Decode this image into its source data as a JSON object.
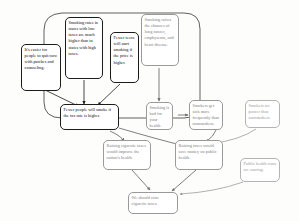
{
  "diagram": {
    "type": "argument-map",
    "background_color": "#fdfdfc",
    "group_label": "reasons-supporting-fewer-people-will-smoke",
    "nodes": [
      {
        "id": "easier-to-quit",
        "text": "It's easier for people to quit now with patches and counseling.",
        "role": "premise",
        "tone": "dark"
      },
      {
        "id": "smoking-rates-low-tax-states",
        "text": "Smoking rates in states with low taxes are much higher than in states with high taxes.",
        "role": "premise",
        "tone": "dark"
      },
      {
        "id": "fewer-teens-start",
        "text": "Fewer teens will start smoking if the price is higher.",
        "role": "premise",
        "tone": "dark"
      },
      {
        "id": "smoking-raises-chances",
        "text": "Smoking raises the chances of lung cancer, emphysema, and heart disease.",
        "role": "premise",
        "tone": "faint"
      },
      {
        "id": "fewer-people-will-smoke",
        "text": "Fewer people will smoke if the tax rate is higher.",
        "role": "intermediate-conclusion",
        "tone": "dark"
      },
      {
        "id": "smoking-bad-for-health",
        "text": "Smoking is bad for your health.",
        "role": "intermediate-conclusion",
        "tone": "faint"
      },
      {
        "id": "smokers-sick-more",
        "text": "Smokers get sick more frequently than nonsmokers.",
        "role": "intermediate-conclusion",
        "tone": "faint"
      },
      {
        "id": "smokers-poorer",
        "text": "Smokers are poorer than nonsmokers.",
        "role": "premise",
        "tone": "vfaint"
      },
      {
        "id": "raising-taxes-improve-health",
        "text": "Raising cigarette taxes would improve the nation's health.",
        "role": "intermediate-conclusion",
        "tone": "faint"
      },
      {
        "id": "raising-taxes-save-money",
        "text": "Raising taxes would save money on public health.",
        "role": "intermediate-conclusion",
        "tone": "faint"
      },
      {
        "id": "public-health-costs-soaring",
        "text": "Public health costs are soaring.",
        "role": "premise",
        "tone": "vfaint"
      },
      {
        "id": "main-conclusion",
        "text": "We should raise cigarette taxes.",
        "role": "main-conclusion",
        "tone": "faint"
      }
    ],
    "edges": [
      {
        "from": "easier-to-quit",
        "to": "fewer-people-will-smoke"
      },
      {
        "from": "smoking-rates-low-tax-states",
        "to": "fewer-people-will-smoke"
      },
      {
        "from": "fewer-teens-start",
        "to": "fewer-people-will-smoke"
      },
      {
        "from": "smoking-raises-chances",
        "to": "smoking-bad-for-health"
      },
      {
        "from": "smoking-bad-for-health",
        "to": "smokers-sick-more"
      },
      {
        "from": "smokers-sick-more",
        "to": "raising-taxes-save-money"
      },
      {
        "from": "smokers-poorer",
        "to": "raising-taxes-save-money"
      },
      {
        "from": "fewer-people-will-smoke",
        "to": "raising-taxes-improve-health"
      },
      {
        "from": "fewer-people-will-smoke",
        "to": "raising-taxes-save-money"
      },
      {
        "from": "raising-taxes-improve-health",
        "to": "main-conclusion"
      },
      {
        "from": "raising-taxes-save-money",
        "to": "main-conclusion"
      },
      {
        "from": "public-health-costs-soaring",
        "to": "main-conclusion"
      }
    ]
  }
}
